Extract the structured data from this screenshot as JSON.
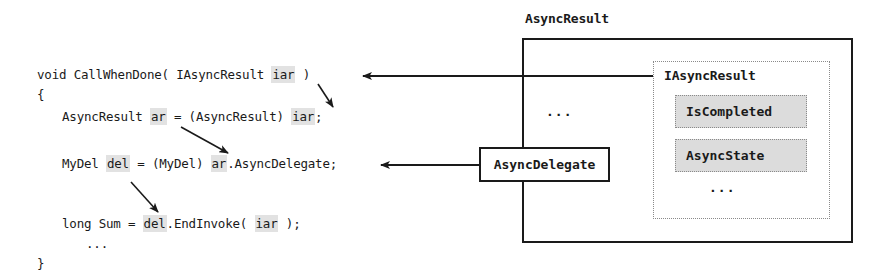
{
  "code": {
    "line1": {
      "pre": "void CallWhenDone( IAsyncResult ",
      "hl": "iar",
      "post": " )"
    },
    "line2": "{",
    "line3": {
      "pre": "AsyncResult ",
      "hl1": "ar",
      "mid": " = (AsyncResult) ",
      "hl2": "iar",
      "post": ";"
    },
    "line4": {
      "pre": "MyDel ",
      "hl1": "del",
      "mid": " = (MyDel) ",
      "hl2": "ar",
      "post": ".AsyncDelegate;"
    },
    "line5": {
      "pre": "long Sum = ",
      "hl1": "del",
      "mid": ".EndInvoke( ",
      "hl2": "iar",
      "post": " );"
    },
    "line6": "...",
    "line7": "}"
  },
  "diagram": {
    "outer_label": "AsyncResult",
    "outer_ellipsis": "...",
    "interface_label": "IAsyncResult",
    "properties": [
      "IsCompleted",
      "AsyncState"
    ],
    "interface_ellipsis": "...",
    "delegate_label": "AsyncDelegate"
  },
  "colors": {
    "line": "#1a1a1a",
    "highlight": "#e2e2e2",
    "property_fill": "#dcdcdc",
    "dotted_border": "#8a8a8a"
  }
}
